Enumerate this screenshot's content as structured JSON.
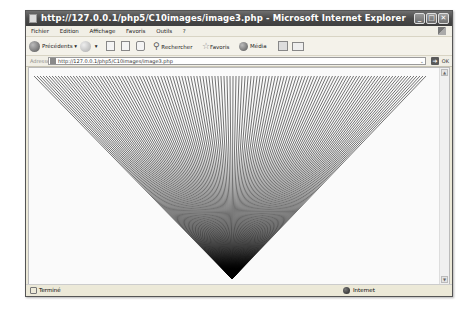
{
  "window": {
    "title": "http://127.0.0.1/php5/C10images/image3.php - Microsoft Internet Explorer",
    "buttons": {
      "minimize": "_",
      "maximize": "□",
      "close": "✕"
    }
  },
  "menubar": {
    "items": [
      "Fichier",
      "Edition",
      "Affichage",
      "Favoris",
      "Outils",
      "?"
    ]
  },
  "toolbar": {
    "back_label": "Précédents",
    "search_label": "Rechercher",
    "favorites_label": "Favoris",
    "media_label": "Média"
  },
  "addressbar": {
    "label": "Adresse",
    "url": "http://127.0.0.1/php5/C10images/image3.php",
    "go_label": "OK"
  },
  "content": {
    "image": {
      "shape": "line-fan-triangle",
      "top_left": [
        33,
        75
      ],
      "top_right": [
        425,
        75
      ],
      "apex": [
        231,
        278
      ],
      "line_color": "#000000",
      "background": "#fafafa"
    }
  },
  "statusbar": {
    "status_text": "Terminé",
    "zone_text": "Internet"
  }
}
